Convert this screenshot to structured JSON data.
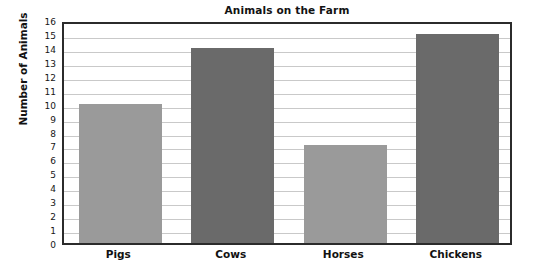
{
  "chart_data": {
    "type": "bar",
    "title": "Animals on the Farm",
    "xlabel": "",
    "ylabel": "Number of Animals",
    "categories": [
      "Pigs",
      "Cows",
      "Horses",
      "Chickens"
    ],
    "values": [
      10,
      14,
      7,
      15
    ],
    "series": [
      {
        "name": "Number of Animals",
        "values": [
          10,
          14,
          7,
          15
        ]
      }
    ],
    "ylim": [
      0,
      16
    ],
    "ytick_step": 1,
    "yticks": [
      0,
      1,
      2,
      3,
      4,
      5,
      6,
      7,
      8,
      9,
      10,
      11,
      12,
      13,
      14,
      15,
      16
    ],
    "ytick_labels": [
      "0",
      "1",
      "2",
      "3",
      "4",
      "5",
      "6",
      "7",
      "8",
      "9",
      "10",
      "11",
      "12",
      "13",
      "14",
      "15",
      "16"
    ],
    "grid": true,
    "grid_axis": "y",
    "legend": false,
    "legend_position": "none",
    "bar_colors": [
      "#9a9a9a",
      "#6a6a6a",
      "#9a9a9a",
      "#6a6a6a"
    ],
    "colors": {
      "bar_light": "#9a9a9a",
      "bar_dark": "#6a6a6a",
      "gridline": "#c9c9c9",
      "axis_border": "#2b2b2b",
      "text": "#121212",
      "plot_background": "#ffffff"
    }
  }
}
